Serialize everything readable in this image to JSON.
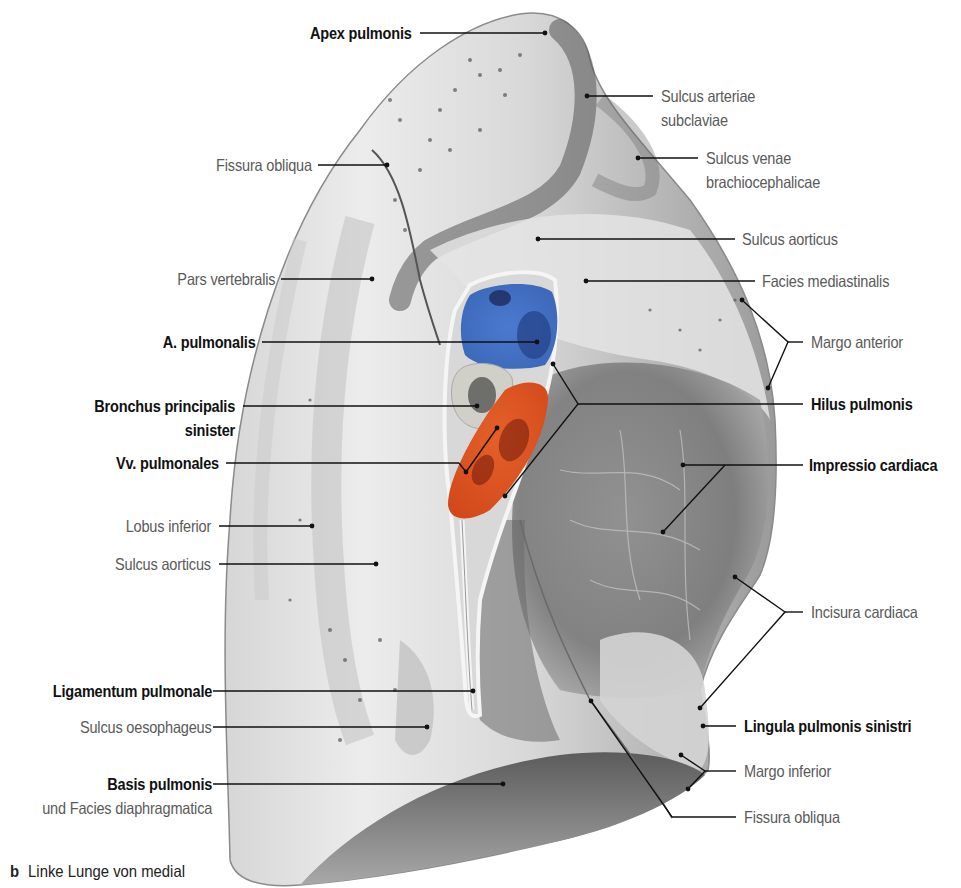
{
  "figure": {
    "caption_letter": "b",
    "caption_text": "Linke Lunge von medial",
    "colors": {
      "artery_blue": "#4472c4",
      "vein_orange": "#e0531f",
      "bronchus_grey": "#cfcfc8",
      "lung_light": "#e8e8e8",
      "lung_dark": "#6e6e6e",
      "label_bold": "#111111",
      "label_grey": "#5a5a5a"
    }
  },
  "labels": {
    "left": [
      {
        "id": "apex_pulmonis",
        "text": "Apex pulmonis",
        "weight": "bold"
      },
      {
        "id": "fissura_obliqua_upper",
        "text": "Fissura obliqua",
        "weight": "normal"
      },
      {
        "id": "pars_vertebralis",
        "text": "Pars vertebralis",
        "weight": "normal"
      },
      {
        "id": "a_pulmonalis",
        "text": "A. pulmonalis",
        "weight": "bold"
      },
      {
        "id": "bronchus_principalis_1",
        "text": "Bronchus principalis",
        "weight": "bold"
      },
      {
        "id": "bronchus_principalis_2",
        "text": "sinister",
        "weight": "bold"
      },
      {
        "id": "vv_pulmonales",
        "text": "Vv. pulmonales",
        "weight": "bold"
      },
      {
        "id": "lobus_inferior",
        "text": "Lobus inferior",
        "weight": "normal"
      },
      {
        "id": "sulcus_aorticus_lower",
        "text": "Sulcus aorticus",
        "weight": "normal"
      },
      {
        "id": "ligamentum_pulmonale",
        "text": "Ligamentum pulmonale",
        "weight": "bold"
      },
      {
        "id": "sulcus_oesophageus",
        "text": "Sulcus oesophageus",
        "weight": "normal"
      },
      {
        "id": "basis_pulmonis",
        "text": "Basis pulmonis",
        "weight": "bold"
      },
      {
        "id": "facies_diaphragmatica",
        "text": "und Facies diaphragmatica",
        "weight": "normal"
      }
    ],
    "right": [
      {
        "id": "sulcus_arteriae_1",
        "text": "Sulcus arteriae",
        "weight": "normal"
      },
      {
        "id": "sulcus_arteriae_2",
        "text": "subclaviae",
        "weight": "normal"
      },
      {
        "id": "sulcus_venae_1",
        "text": "Sulcus venae",
        "weight": "normal"
      },
      {
        "id": "sulcus_venae_2",
        "text": "brachiocephalicae",
        "weight": "normal"
      },
      {
        "id": "sulcus_aorticus_upper",
        "text": "Sulcus aorticus",
        "weight": "normal"
      },
      {
        "id": "facies_mediastinalis",
        "text": "Facies mediastinalis",
        "weight": "normal"
      },
      {
        "id": "margo_anterior",
        "text": "Margo anterior",
        "weight": "normal"
      },
      {
        "id": "hilus_pulmonis",
        "text": "Hilus pulmonis",
        "weight": "bold"
      },
      {
        "id": "impressio_cardiaca",
        "text": "Impressio cardiaca",
        "weight": "bold"
      },
      {
        "id": "incisura_cardiaca",
        "text": "Incisura cardiaca",
        "weight": "normal"
      },
      {
        "id": "lingula",
        "text": "Lingula pulmonis sinistri",
        "weight": "bold"
      },
      {
        "id": "margo_inferior",
        "text": "Margo inferior",
        "weight": "normal"
      },
      {
        "id": "fissura_obliqua_lower",
        "text": "Fissura obliqua",
        "weight": "normal"
      }
    ]
  }
}
